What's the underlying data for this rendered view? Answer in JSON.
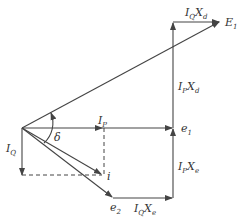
{
  "diagram": {
    "type": "phasor-diagram",
    "colors": {
      "line": "#444444",
      "text": "#333333",
      "background": "#ffffff"
    },
    "labels": {
      "E1": {
        "main": "E",
        "sub": "1"
      },
      "IQXd": {
        "main1": "I",
        "sub1": "Q",
        "main2": "X",
        "sub2": "d"
      },
      "IPXd": {
        "main1": "I",
        "sub1": "P",
        "main2": "X",
        "sub2": "d"
      },
      "IP": {
        "main": "I",
        "sub": "P"
      },
      "e1": {
        "main": "e",
        "sub": "1"
      },
      "delta": "δ",
      "IQ": {
        "main": "I",
        "sub": "Q"
      },
      "i": "i",
      "IPXe": {
        "main1": "I",
        "sub1": "P",
        "main2": "X",
        "sub2": "e"
      },
      "e2": {
        "main": "e",
        "sub": "2"
      },
      "IQXe": {
        "main1": "I",
        "sub1": "Q",
        "main2": "X",
        "sub2": "e"
      }
    },
    "points": {
      "origin": [
        22,
        128
      ],
      "E1": [
        220,
        22
      ],
      "e1": [
        173,
        128
      ],
      "IP_tip": [
        102,
        128
      ],
      "IQ_tip": [
        22,
        175
      ],
      "i": [
        102,
        175
      ],
      "e2": [
        113,
        198
      ],
      "corner_bottom": [
        173,
        198
      ],
      "corner_top": [
        173,
        22
      ]
    }
  }
}
